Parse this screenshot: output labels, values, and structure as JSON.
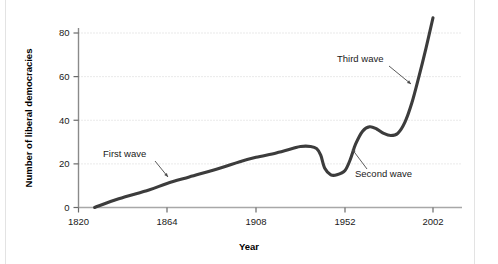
{
  "chart_data": {
    "type": "line",
    "title": "",
    "xlabel": "Year",
    "ylabel": "Number of liberal democracies",
    "xlim": [
      1820,
      2002
    ],
    "ylim": [
      0,
      90
    ],
    "xticks": [
      "1820",
      "1864",
      "1908",
      "1952",
      "2002"
    ],
    "xtick_values": [
      1820,
      1864,
      1908,
      1952,
      2002
    ],
    "yticks": [
      "0",
      "20",
      "40",
      "60",
      "80"
    ],
    "ytick_values": [
      0,
      20,
      40,
      60,
      80
    ],
    "grid": "horizontal-dotted",
    "legend": "none",
    "series": [
      {
        "name": "Number of liberal democracies",
        "color": "#3c3c3c",
        "x": [
          1828,
          1840,
          1855,
          1864,
          1875,
          1890,
          1900,
          1908,
          1918,
          1926,
          1930,
          1935,
          1938,
          1940,
          1942,
          1945,
          1948,
          1952,
          1955,
          1958,
          1962,
          1966,
          1970,
          1974,
          1978,
          1982,
          1986,
          1990,
          1994,
          1998,
          2002
        ],
        "y": [
          0,
          4,
          8,
          11,
          14,
          18,
          21,
          23,
          25,
          27,
          28,
          28,
          27,
          24,
          18,
          15,
          15,
          17,
          22,
          29,
          35,
          37,
          36,
          34,
          33,
          34,
          39,
          48,
          60,
          73,
          87
        ]
      }
    ],
    "annotations": [
      {
        "label": "First wave",
        "text_x": 103,
        "text_y": 157,
        "leader": {
          "x1": 155,
          "y1": 161,
          "x2": 168,
          "y2": 177
        }
      },
      {
        "label": "Second wave",
        "text_x": 355,
        "text_y": 177,
        "leader": {
          "x1": 367,
          "y1": 169,
          "x2": 352,
          "y2": 149
        }
      },
      {
        "label": "Third wave",
        "text_x": 337,
        "text_y": 62,
        "leader": {
          "x1": 389,
          "y1": 66,
          "x2": 411,
          "y2": 84
        }
      }
    ]
  },
  "axes": {
    "x_title": "Year",
    "y_title": "Number of liberal democracies"
  }
}
